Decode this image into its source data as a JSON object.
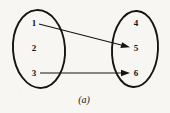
{
  "figure": {
    "caption": "(a)",
    "background_color": "#f7f6f3",
    "ink_color": "#141414",
    "width": 170,
    "height": 113
  },
  "diagram": {
    "type": "mapping-diagram",
    "sets": [
      {
        "id": "domain",
        "name": "left-set",
        "shape": "ellipse",
        "center_x": 39,
        "center_y": 49,
        "radius_x": 26,
        "radius_y": 39,
        "elements": [
          {
            "label": "1",
            "x": 34,
            "y": 23
          },
          {
            "label": "2",
            "x": 34,
            "y": 48
          },
          {
            "label": "3",
            "x": 34,
            "y": 73
          }
        ]
      },
      {
        "id": "codomain",
        "name": "right-set",
        "shape": "ellipse",
        "center_x": 135,
        "center_y": 49,
        "radius_x": 23,
        "radius_y": 38,
        "elements": [
          {
            "label": "4",
            "x": 136,
            "y": 23
          },
          {
            "label": "5",
            "x": 136,
            "y": 48
          },
          {
            "label": "6",
            "x": 136,
            "y": 73
          }
        ]
      }
    ],
    "arrows": [
      {
        "name": "arrow-1-to-5",
        "from_label": "1",
        "to_label": "5",
        "x1": 39,
        "y1": 24,
        "x2": 129,
        "y2": 47,
        "style": "straight-diagonal"
      },
      {
        "name": "arrow-3-to-6",
        "from_label": "3",
        "to_label": "6",
        "x1": 40,
        "y1": 73,
        "x2": 129,
        "y2": 73,
        "style": "straight-horizontal"
      }
    ]
  }
}
